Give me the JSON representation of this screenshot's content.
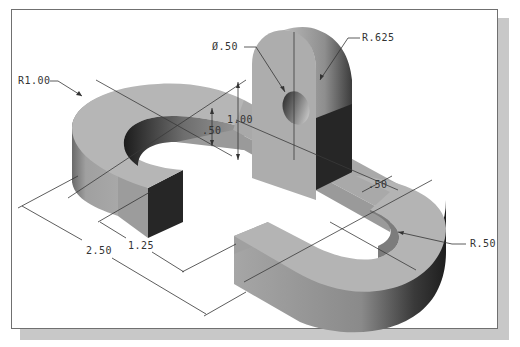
{
  "figure": {
    "type": "isometric-engineering-drawing",
    "colors": {
      "frame_border": "#707070",
      "frame_shadow": "#c8c8c8",
      "top_face": "#b4b4b4",
      "side_face_light": "#9a9a9a",
      "side_face_dark": "#262626",
      "dimension_line": "#333333"
    }
  },
  "dimensions": {
    "r1": {
      "label": "R1.00",
      "x": 18,
      "y": 84
    },
    "dia": {
      "label": "Ø.50",
      "x": 212,
      "y": 50
    },
    "r625": {
      "label": "R.625",
      "x": 364,
      "y": 41
    },
    "h100": {
      "label": "1.00",
      "x": 228,
      "y": 123
    },
    "h50": {
      "label": ".50",
      "x": 204,
      "y": 134
    },
    "w50": {
      "label": ".50",
      "x": 370,
      "y": 188
    },
    "r50": {
      "label": "R.50",
      "x": 471,
      "y": 246
    },
    "l250": {
      "label": "2.50",
      "x": 86,
      "y": 254
    },
    "l125": {
      "label": "1.25",
      "x": 128,
      "y": 249
    }
  }
}
